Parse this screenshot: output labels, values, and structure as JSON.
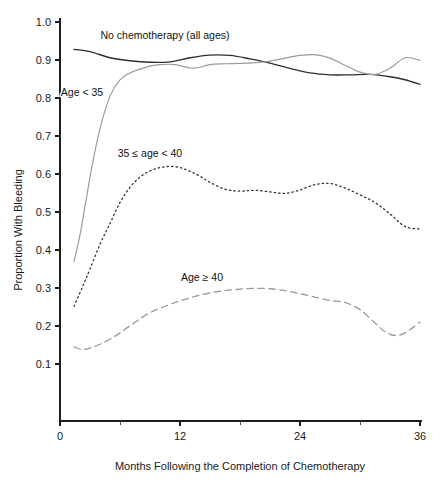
{
  "chart_data": {
    "type": "line",
    "title": "",
    "xlabel": "Months Following the Completion of Chemotherapy",
    "ylabel": "Proportion With Bleeding",
    "xlim": [
      0,
      36
    ],
    "ylim": [
      0.0,
      1.0
    ],
    "xticks": [
      "0",
      "12",
      "24",
      "36"
    ],
    "xtick_values": [
      0,
      12,
      24,
      36
    ],
    "xminor_values": [
      6,
      18,
      30
    ],
    "yticks": [
      "0.1",
      "0.2",
      "0.3",
      "0.4",
      "0.5",
      "0.6",
      "0.7",
      "0.8",
      "0.9",
      "1.0"
    ],
    "ytick_values": [
      0.1,
      0.2,
      0.3,
      0.4,
      0.5,
      0.6,
      0.7,
      0.8,
      0.9,
      1.0
    ],
    "grid": false,
    "legend_position": "inline-annotations",
    "series": [
      {
        "name": "No chemotherapy (all ages)",
        "style": "solid",
        "color": "#2e2e2e",
        "label_x": 10.5,
        "label_y": 0.955,
        "x": [
          1.4,
          3,
          5,
          7,
          9,
          11,
          13,
          15,
          17,
          19,
          21,
          23,
          25,
          27,
          29,
          31,
          33,
          34.5,
          36
        ],
        "y": [
          0.928,
          0.922,
          0.906,
          0.898,
          0.894,
          0.895,
          0.906,
          0.913,
          0.912,
          0.903,
          0.892,
          0.878,
          0.866,
          0.861,
          0.861,
          0.862,
          0.856,
          0.848,
          0.836
        ]
      },
      {
        "name": "Age < 35",
        "style": "solid-light",
        "color": "#9a9a9a",
        "label_x": 2.2,
        "label_y": 0.805,
        "x": [
          1.4,
          2,
          2.6,
          3.2,
          4,
          5,
          6,
          7,
          8,
          9,
          10,
          11.5,
          13,
          14,
          15,
          16.5,
          18,
          19.5,
          21,
          22.5,
          24,
          25.5,
          27,
          28.5,
          30,
          31.5,
          33,
          34.5,
          36
        ],
        "y": [
          0.37,
          0.44,
          0.53,
          0.62,
          0.72,
          0.805,
          0.848,
          0.866,
          0.876,
          0.884,
          0.888,
          0.888,
          0.879,
          0.881,
          0.888,
          0.89,
          0.891,
          0.893,
          0.897,
          0.905,
          0.912,
          0.914,
          0.905,
          0.886,
          0.868,
          0.862,
          0.878,
          0.906,
          0.899
        ]
      },
      {
        "name": "35 ≤ age < 40",
        "style": "dotted",
        "color": "#333333",
        "label_x": 9.0,
        "label_y": 0.645,
        "x": [
          1.4,
          2.2,
          3,
          4,
          5,
          6,
          7,
          8,
          9,
          10,
          11,
          12,
          13,
          14,
          15,
          16.5,
          18,
          19.5,
          21,
          22.5,
          24,
          25.5,
          27,
          28.5,
          30,
          31.5,
          33,
          34.5,
          36
        ],
        "y": [
          0.252,
          0.3,
          0.35,
          0.415,
          0.47,
          0.525,
          0.565,
          0.592,
          0.608,
          0.617,
          0.62,
          0.617,
          0.607,
          0.594,
          0.578,
          0.56,
          0.555,
          0.557,
          0.553,
          0.549,
          0.558,
          0.572,
          0.575,
          0.563,
          0.545,
          0.525,
          0.495,
          0.462,
          0.455
        ]
      },
      {
        "name": "Age ≥ 40",
        "style": "dashed",
        "color": "#9a9a9a",
        "label_x": 14.2,
        "label_y": 0.318,
        "x": [
          1.4,
          2.2,
          3,
          4,
          5,
          6,
          7.5,
          9,
          10.5,
          12,
          13.5,
          15,
          16.5,
          18,
          19.5,
          21,
          22.5,
          24,
          25.5,
          27,
          28.5,
          30,
          31.5,
          32.5,
          33.5,
          34.5,
          36
        ],
        "y": [
          0.145,
          0.138,
          0.142,
          0.152,
          0.165,
          0.182,
          0.21,
          0.235,
          0.252,
          0.266,
          0.278,
          0.287,
          0.293,
          0.297,
          0.299,
          0.298,
          0.293,
          0.285,
          0.276,
          0.267,
          0.262,
          0.243,
          0.208,
          0.185,
          0.175,
          0.182,
          0.21
        ]
      }
    ]
  },
  "axis": {
    "y_title": "Proportion With Bleeding",
    "x_title": "Months Following the Completion of Chemotherapy"
  },
  "labels": {
    "nochemo": "No chemotherapy (all ages)",
    "lt35": "Age < 35",
    "mid": "35 ≤ age < 40",
    "ge40": "Age ≥ 40"
  }
}
